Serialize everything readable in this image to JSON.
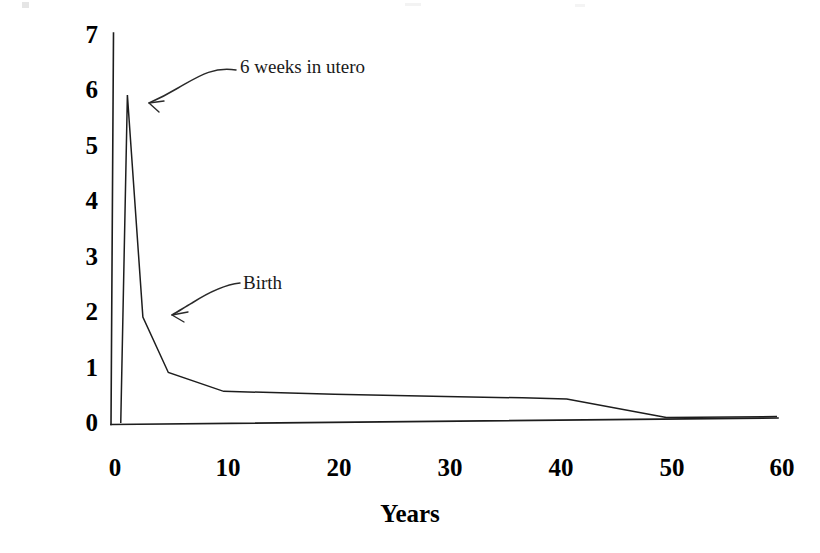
{
  "chart_data": {
    "type": "line",
    "title": "",
    "subtitle": "",
    "xlabel": "Years",
    "ylabel": "Millions of Oocytes",
    "xlim": [
      0,
      60
    ],
    "ylim": [
      0,
      7
    ],
    "xticks": [
      0,
      10,
      20,
      30,
      40,
      50,
      60
    ],
    "xtick_labels": [
      "0",
      "10",
      "20",
      "30",
      "40",
      "50",
      "60"
    ],
    "yticks": [
      0,
      1,
      2,
      3,
      4,
      5,
      6,
      7
    ],
    "ytick_labels": [
      "0",
      "1",
      "2",
      "3",
      "4",
      "5",
      "6",
      "7"
    ],
    "grid": false,
    "legend": false,
    "legend_position": "none",
    "series": [
      {
        "name": "Oocyte number",
        "color": "#1d1d1d",
        "x": [
          0.7,
          1.3,
          2.7,
          5.0,
          10.0,
          20.0,
          30.0,
          37.0,
          41.0,
          50.0,
          60.0
        ],
        "y": [
          0.0,
          5.9,
          1.9,
          0.9,
          0.55,
          0.48,
          0.42,
          0.38,
          0.35,
          0.0,
          0.0
        ]
      }
    ],
    "annotations": [
      {
        "id": "six-weeks-in-utero",
        "text": "6 weeks in utero",
        "label_x": 240,
        "label_y": 56,
        "points_to_x": 1.3,
        "points_to_y": 6.4
      },
      {
        "id": "birth",
        "text": "Birth",
        "label_x": 243,
        "label_y": 272,
        "points_to_x": 2.7,
        "points_to_y": 2.2
      }
    ]
  },
  "axis": {
    "y_title": "Millions of Oocytes",
    "x_title": "Years"
  }
}
